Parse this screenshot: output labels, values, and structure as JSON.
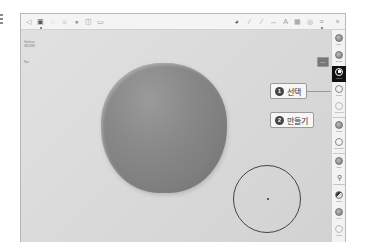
{
  "app": {
    "canvas_background": "#dedede",
    "sphere_color": "#858585",
    "active_tool_color": "#111111"
  },
  "left_stub": {
    "lines": 3
  },
  "topbar": {
    "left_icons": [
      {
        "name": "file-icon",
        "glyph": "◁"
      },
      {
        "name": "scene-icon",
        "glyph": "▣"
      },
      {
        "name": "settings-icon",
        "glyph": "◌"
      },
      {
        "name": "camera-icon",
        "glyph": "☼"
      },
      {
        "name": "render-icon",
        "glyph": "●"
      },
      {
        "name": "topology-icon",
        "glyph": "◫"
      },
      {
        "name": "layers-icon",
        "glyph": "▭"
      }
    ],
    "right_icons": [
      {
        "name": "material-icon",
        "glyph": "◕"
      },
      {
        "name": "stroke-icon",
        "glyph": "⁄"
      },
      {
        "name": "brush-settings-icon",
        "glyph": "⁄"
      },
      {
        "name": "symmetry-icon",
        "glyph": "↔"
      },
      {
        "name": "text-icon",
        "glyph": "A"
      },
      {
        "name": "grid-icon",
        "glyph": "▦"
      },
      {
        "name": "view-icon",
        "glyph": "◎"
      },
      {
        "name": "history-icon",
        "glyph": "≡"
      },
      {
        "name": "undo-redo-icon",
        "glyph": "»"
      }
    ]
  },
  "info_text": {
    "line1": "Vertices",
    "line2": "482,888",
    "line3": "Fps"
  },
  "canvas": {
    "share_button": "Share"
  },
  "tools": [
    {
      "label": "Clay",
      "icon": "clay-icon",
      "style": "ball"
    },
    {
      "label": "Brush",
      "icon": "brush-icon",
      "style": "ball"
    },
    {
      "label": "Move",
      "icon": "move-icon",
      "style": "active"
    },
    {
      "label": "Drag",
      "icon": "drag-icon",
      "style": "ring"
    },
    {
      "label": "Smooth",
      "icon": "smooth-icon",
      "style": "light"
    },
    {
      "label": "Mask",
      "icon": "mask-icon",
      "style": "ball"
    },
    {
      "label": "SelMask",
      "icon": "selmask-icon",
      "style": "ring"
    },
    {
      "label": "Trim",
      "icon": "trim-icon",
      "style": "ball"
    },
    {
      "label": "Transform",
      "icon": "transform-icon",
      "style": "pin"
    },
    {
      "label": "Paint",
      "icon": "paint-icon",
      "style": "half"
    },
    {
      "label": "Layer",
      "icon": "layer-icon",
      "style": "ball"
    },
    {
      "label": "Insert",
      "icon": "insert-icon",
      "style": "light"
    }
  ],
  "callouts": [
    {
      "number": "1",
      "text": "선택"
    },
    {
      "number": "2",
      "text": "만들기"
    }
  ]
}
